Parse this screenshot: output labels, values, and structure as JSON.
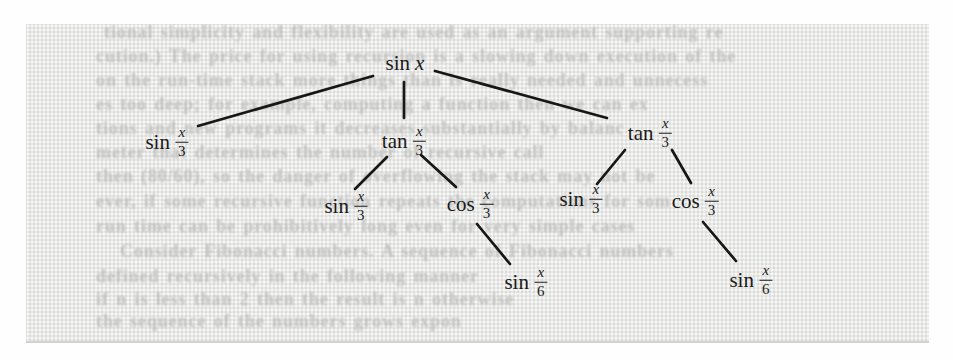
{
  "figure": {
    "kind": "scanned textbook figure",
    "background_color": "#fefefe",
    "panel_color": "#eaeae8",
    "ink_color": "#171717",
    "ghost_text_color": "#bdbfbb"
  },
  "diagram": {
    "type": "tree",
    "nodes": [
      {
        "id": "root",
        "fn": "sin",
        "arg": "x",
        "x": 406,
        "y": 63
      },
      {
        "id": "n1",
        "fn": "sin",
        "num": "x",
        "den": "3",
        "x": 167,
        "y": 142
      },
      {
        "id": "n2",
        "fn": "tan",
        "num": "x",
        "den": "3",
        "x": 404,
        "y": 141
      },
      {
        "id": "n3",
        "fn": "tan",
        "num": "x",
        "den": "3",
        "x": 650,
        "y": 133
      },
      {
        "id": "n4",
        "fn": "sin",
        "num": "x",
        "den": "3",
        "x": 346,
        "y": 206
      },
      {
        "id": "n5",
        "fn": "cos",
        "num": "x",
        "den": "3",
        "x": 470,
        "y": 204
      },
      {
        "id": "n6",
        "fn": "sin",
        "num": "x",
        "den": "3",
        "x": 581,
        "y": 199
      },
      {
        "id": "n7",
        "fn": "cos",
        "num": "x",
        "den": "3",
        "x": 695,
        "y": 201
      },
      {
        "id": "n8",
        "fn": "sin",
        "num": "x",
        "den": "6",
        "x": 526,
        "y": 282
      },
      {
        "id": "n9",
        "fn": "sin",
        "num": "x",
        "den": "6",
        "x": 751,
        "y": 280
      }
    ],
    "edges": [
      {
        "from": "root",
        "to": "n1",
        "x1": 373,
        "y1": 76,
        "x2": 198,
        "y2": 126
      },
      {
        "from": "root",
        "to": "n2",
        "x1": 404,
        "y1": 82,
        "x2": 404,
        "y2": 118
      },
      {
        "from": "root",
        "to": "n3",
        "x1": 435,
        "y1": 71,
        "x2": 607,
        "y2": 118
      },
      {
        "from": "n2",
        "to": "n4",
        "x1": 387,
        "y1": 157,
        "x2": 355,
        "y2": 189
      },
      {
        "from": "n2",
        "to": "n5",
        "x1": 421,
        "y1": 155,
        "x2": 456,
        "y2": 187
      },
      {
        "from": "n5",
        "to": "n8",
        "x1": 477,
        "y1": 224,
        "x2": 510,
        "y2": 264
      },
      {
        "from": "n3",
        "to": "n6",
        "x1": 625,
        "y1": 150,
        "x2": 597,
        "y2": 184
      },
      {
        "from": "n3",
        "to": "n7",
        "x1": 672,
        "y1": 150,
        "x2": 691,
        "y2": 183
      },
      {
        "from": "n7",
        "to": "n9",
        "x1": 703,
        "y1": 222,
        "x2": 736,
        "y2": 261
      }
    ]
  },
  "ghost_text": {
    "note": "barely legible show-through print from the other side of the scanned page",
    "lines": [
      {
        "x": 78,
        "y": -2,
        "text": "tional simplicity and flexibility are used as an argument supporting re"
      },
      {
        "x": 70,
        "y": 22,
        "text": "cution.) The price for using recursion is a slowing down execution of the"
      },
      {
        "x": 70,
        "y": 46,
        "text": "on the run-time stack more things than is really needed and unnecess"
      },
      {
        "x": 70,
        "y": 70,
        "text": "es too deep; for example, computing a function then we can ex"
      },
      {
        "x": 70,
        "y": 94,
        "text": "tions and new programs it decreases substantially by balanc"
      },
      {
        "x": 70,
        "y": 118,
        "text": "meter that determines the number of recursive call"
      },
      {
        "x": 70,
        "y": 142,
        "text": "then (80/60), so the danger of overflowing the stack may not be"
      },
      {
        "x": 70,
        "y": 167,
        "text": "ever, if some recursive function repeats the computations for som"
      },
      {
        "x": 70,
        "y": 192,
        "text": "run time can be prohibitively long even for very simple cases"
      },
      {
        "x": 94,
        "y": 217,
        "text": "Consider Fibonacci numbers. A sequence of Fibonacci numbers"
      },
      {
        "x": 70,
        "y": 242,
        "text": "defined recursively in the following manner"
      },
      {
        "x": 70,
        "y": 265,
        "text": "if n is less than 2 then the result is n otherwise"
      },
      {
        "x": 70,
        "y": 287,
        "text": "the sequence of the numbers grows expon"
      }
    ]
  }
}
